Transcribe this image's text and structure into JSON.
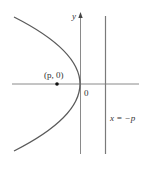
{
  "diagram": {
    "type": "parabola",
    "labels": {
      "y_axis": "y",
      "origin": "0",
      "focus": "(p, 0)",
      "directrix": "x = −p"
    },
    "colors": {
      "curve": "#555555",
      "axes": "#888888",
      "directrix": "#777777",
      "focus_point": "#111111",
      "text": "#333333"
    }
  }
}
